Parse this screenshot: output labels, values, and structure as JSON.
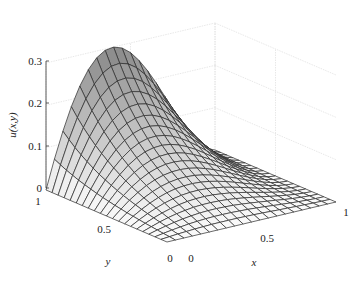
{
  "chart_data": {
    "type": "surface3d",
    "title": "",
    "xlabel": "x",
    "ylabel": "y",
    "zlabel": "u(x,y)",
    "xlim": [
      0,
      1
    ],
    "ylim": [
      0,
      1
    ],
    "zlim": [
      0,
      0.3
    ],
    "x_ticks": [
      "0",
      "0.5",
      "1"
    ],
    "y_ticks": [
      "0",
      "0.5",
      "1"
    ],
    "z_ticks": [
      "0",
      "0.1",
      "0.2",
      "0.3"
    ],
    "grid": true,
    "mesh_resolution": 20,
    "colormap": "gray",
    "peak": {
      "x": 0.35,
      "y": 1.0,
      "u": 0.3
    },
    "boundary": "u=0 on x=0, x=1, y=0; nonzero on y=1"
  },
  "labels": {
    "xlabel": "x",
    "ylabel": "y",
    "zlabel": "u(x,y)",
    "x0": "0",
    "x05": "0.5",
    "x1": "1",
    "y0": "0",
    "y05": "0.5",
    "y1": "1",
    "z0": "0",
    "z01": "0.1",
    "z02": "0.2",
    "z03": "0.3"
  }
}
